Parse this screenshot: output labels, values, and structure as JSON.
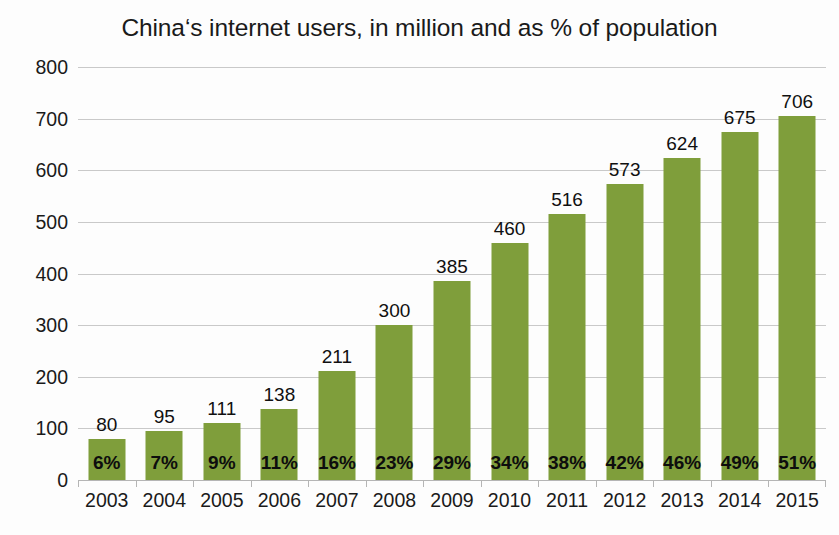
{
  "chart_data": {
    "type": "bar",
    "title": "China‘s internet users, in million and as % of population",
    "xlabel": "",
    "ylabel": "",
    "ylim": [
      0,
      800
    ],
    "ytick_step": 100,
    "yticks": [
      "800",
      "700",
      "600",
      "500",
      "400",
      "300",
      "200",
      "100",
      "0"
    ],
    "grid": true,
    "legend": "none",
    "bar_color": "#7f9e3b",
    "gridline_color": "#c9c9c9",
    "axis_color": "#b5b5b5",
    "text_color": "#1a1a1a",
    "background_color": "#fdfdfd",
    "categories": [
      "2003",
      "2004",
      "2005",
      "2006",
      "2007",
      "2008",
      "2009",
      "2010",
      "2011",
      "2012",
      "2013",
      "2014",
      "2015"
    ],
    "values": [
      80,
      95,
      111,
      138,
      211,
      300,
      385,
      460,
      516,
      573,
      624,
      675,
      706
    ],
    "value_labels": [
      "80",
      "95",
      "111",
      "138",
      "211",
      "300",
      "385",
      "460",
      "516",
      "573",
      "624",
      "675",
      "706"
    ],
    "percent_labels": [
      "6%",
      "7%",
      "9%",
      "11%",
      "16%",
      "23%",
      "29%",
      "34%",
      "38%",
      "42%",
      "46%",
      "49%",
      "51%"
    ],
    "percent_values": [
      6,
      7,
      9,
      11,
      16,
      23,
      29,
      34,
      38,
      42,
      46,
      49,
      51
    ],
    "series": [
      {
        "name": "Internet users (million)",
        "values": [
          80,
          95,
          111,
          138,
          211,
          300,
          385,
          460,
          516,
          573,
          624,
          675,
          706
        ]
      },
      {
        "name": "Share of population (%)",
        "values": [
          6,
          7,
          9,
          11,
          16,
          23,
          29,
          34,
          38,
          42,
          46,
          49,
          51
        ]
      }
    ]
  }
}
